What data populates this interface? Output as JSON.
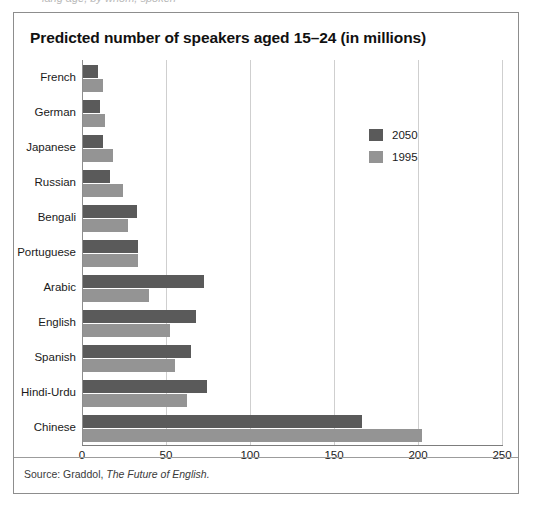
{
  "page": {
    "top_cut_text": "lang age, by whom, spoken"
  },
  "figure": {
    "title": "Predicted number of speakers aged 15–24 (in millions)",
    "source_prefix": "Source: Graddol,",
    "source_title": "The Future of English.",
    "border_color": "#8d8d8d"
  },
  "legend": {
    "position": "inside-right-top",
    "items": [
      {
        "label": "2050",
        "color": "#5a5a5a"
      },
      {
        "label": "1995",
        "color": "#949494"
      }
    ]
  },
  "chart_data": {
    "type": "bar",
    "orientation": "horizontal",
    "title": "Predicted number of speakers aged 15–24 (in millions)",
    "xlabel": "",
    "ylabel": "",
    "xlim": [
      0,
      250
    ],
    "xticks": [
      0,
      50,
      100,
      150,
      200,
      250
    ],
    "xtick_labels": [
      "0",
      "50",
      "100",
      "150",
      "200",
      "250"
    ],
    "grid": true,
    "grid_axis": "x",
    "legend_position": "inside-right-top",
    "categories": [
      "French",
      "German",
      "Japanese",
      "Russian",
      "Bengali",
      "Portuguese",
      "Arabic",
      "English",
      "Spanish",
      "Hindi-Urdu",
      "Chinese"
    ],
    "series": [
      {
        "name": "2050",
        "color": "#5a5a5a",
        "values": [
          9,
          10,
          12,
          16,
          32,
          33,
          72,
          67,
          64,
          74,
          166
        ]
      },
      {
        "name": "1995",
        "color": "#949494",
        "values": [
          12,
          13,
          18,
          24,
          27,
          33,
          39,
          52,
          55,
          62,
          202
        ]
      }
    ]
  }
}
